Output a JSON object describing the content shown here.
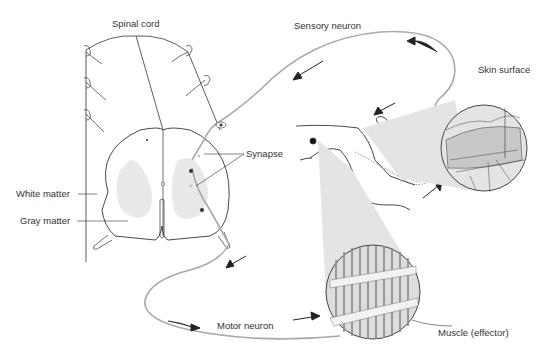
{
  "diagram": {
    "labels": {
      "spinal_cord": "Spinal cord",
      "sensory_neuron": "Sensory neuron",
      "skin_surface": "Skin surface",
      "synapse": "Synapse",
      "white_matter": "White matter",
      "gray_matter": "Gray matter",
      "motor_neuron": "Motor neuron",
      "muscle": "Muscle (effector)"
    },
    "colors": {
      "neuron_path": "#a8a8a8",
      "outline": "#333333",
      "shading": "#e6e6e6",
      "text": "#333333"
    }
  }
}
